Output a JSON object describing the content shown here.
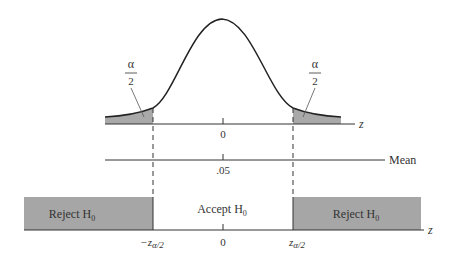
{
  "diagram": {
    "top_panel": {
      "axis_label": "z",
      "center_tick": "0",
      "left_tail_label": {
        "num": "α",
        "den": "2"
      },
      "right_tail_label": {
        "num": "α",
        "den": "2"
      }
    },
    "middle_panel": {
      "axis_label": "Mean",
      "center_tick": ".05"
    },
    "bottom_panel": {
      "axis_label": "z",
      "left_region": "Reject H",
      "left_region_sub": "0",
      "center_region": "Accept H",
      "center_region_sub": "0",
      "right_region": "Reject H",
      "right_region_sub": "0",
      "left_critical": "−z",
      "left_critical_sub": "α/2",
      "center_tick": "0",
      "right_critical": "z",
      "right_critical_sub": "α/2"
    },
    "colors": {
      "shade": "#a9a9a9",
      "line": "#333333",
      "reject_fill": "#a6a6a6"
    }
  }
}
